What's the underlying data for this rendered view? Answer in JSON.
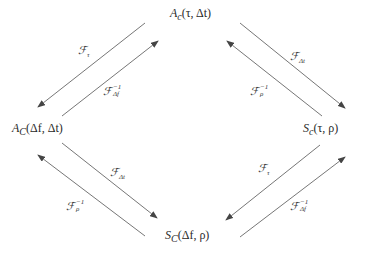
{
  "diagram": {
    "type": "commutative-transform-diagram",
    "nodes": {
      "top": {
        "base": "A",
        "sub": "c",
        "args": "(τ, Δt)"
      },
      "left": {
        "base": "A",
        "sub": "C",
        "args": "(Δf, Δt)"
      },
      "right": {
        "base": "S",
        "sub": "c",
        "args": "(τ, ρ)"
      },
      "bottom": {
        "base": "S",
        "sub": "C",
        "args": "(Δf, ρ)"
      }
    },
    "edges": {
      "top_to_left": {
        "op": "ℱ",
        "sub": "τ",
        "sup": ""
      },
      "left_to_top": {
        "op": "ℱ",
        "sub": "Δf",
        "sup": "−1"
      },
      "top_to_right": {
        "op": "ℱ",
        "sub": "Δt",
        "sup": ""
      },
      "right_to_top": {
        "op": "ℱ",
        "sub": "ρ",
        "sup": "−1"
      },
      "left_to_bottom": {
        "op": "ℱ",
        "sub": "Δt",
        "sup": ""
      },
      "bottom_to_left": {
        "op": "ℱ",
        "sub": "ρ",
        "sup": "−1"
      },
      "right_to_bottom": {
        "op": "ℱ",
        "sub": "τ",
        "sup": ""
      },
      "bottom_to_right": {
        "op": "ℱ",
        "sub": "Δf",
        "sup": "−1"
      }
    },
    "line_color": "#555555"
  }
}
